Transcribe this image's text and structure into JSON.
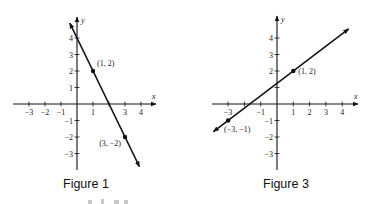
{
  "chart_data": [
    {
      "type": "line",
      "title": "Figure 1",
      "xlabel": "x",
      "ylabel": "y",
      "xlim": [
        -3.9,
        4.7
      ],
      "ylim": [
        -4.1,
        5.3
      ],
      "grid": false,
      "x_ticks": [
        -3,
        -2,
        -1,
        1,
        3,
        4
      ],
      "x_tick_labels": [
        "−3",
        "−2",
        "−1",
        "1",
        "3",
        "4"
      ],
      "x_tick_marks": [
        -3,
        -2,
        -1,
        1,
        2,
        3,
        4
      ],
      "y_ticks": [
        4,
        3,
        2,
        1,
        -1,
        -2,
        -3
      ],
      "y_tick_labels": [
        "4",
        "3",
        "2",
        "1",
        "−1",
        "−2",
        "−3"
      ],
      "line": {
        "slope": -2,
        "intercept": 4,
        "x_range": [
          -0.45,
          3.9
        ]
      },
      "points": [
        {
          "x": 1,
          "y": 2,
          "label": "(1, 2)"
        },
        {
          "x": 3,
          "y": -2,
          "label": "(3, −2)"
        }
      ]
    },
    {
      "type": "line",
      "title": "Figure 3",
      "xlabel": "x",
      "ylabel": "y",
      "xlim": [
        -4,
        5
      ],
      "ylim": [
        -4,
        5.3
      ],
      "grid": false,
      "x_ticks": [
        -3,
        -1,
        1,
        2,
        3,
        4
      ],
      "x_tick_labels": [
        "−3",
        "−1",
        "1",
        "2",
        "3",
        "4"
      ],
      "x_tick_marks": [
        -3,
        -2,
        -1,
        1,
        2,
        3,
        4
      ],
      "y_ticks": [
        4,
        3,
        2,
        1,
        -1,
        -2,
        -3
      ],
      "y_tick_labels": [
        "4",
        "3",
        "2",
        "",
        "−1",
        "−2",
        "−3"
      ],
      "line": {
        "slope": 0.75,
        "intercept": 1.25,
        "x_range": [
          -3.9,
          4.4
        ]
      },
      "points": [
        {
          "x": 1,
          "y": 2,
          "label": "(1, 2)"
        },
        {
          "x": -3,
          "y": -1,
          "label": "(−3, −1)"
        }
      ]
    }
  ],
  "captions": [
    "Figure 1",
    "Figure 3"
  ]
}
